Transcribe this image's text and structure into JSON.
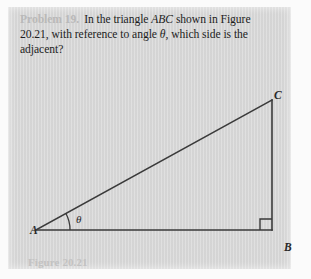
{
  "page": {
    "background_color": "#ffffff",
    "panel_color": "#d7d7d7"
  },
  "problem": {
    "label": "Problem 19.",
    "label_color": "#b9b9b9",
    "line1_a": "In the triangle ",
    "line1_italic": "ABC",
    "line1_b": " shown in",
    "line2_a": "Figure 20.21, with reference to angle ",
    "line2_italic": "θ",
    "line2_b": ", which side",
    "line3": "is the adjacent?"
  },
  "figure": {
    "caption": "Figure 20.21",
    "caption_color": "#c2c2c2",
    "stroke_color": "#3a3a3a",
    "vertices": {
      "A": {
        "label": "A",
        "x": 28,
        "y": 223
      },
      "B": {
        "label": "B",
        "x": 264,
        "y": 223
      },
      "C": {
        "label": "C",
        "x": 264,
        "y": 93
      }
    },
    "angle": {
      "label": "θ",
      "at_vertex": "A",
      "arc_radius": 34
    },
    "right_angle": {
      "at_vertex": "B",
      "marker": "square",
      "size": 11
    },
    "sides": [
      {
        "name": "hypotenuse",
        "from": "A",
        "to": "C"
      },
      {
        "name": "adjacent",
        "from": "A",
        "to": "B"
      },
      {
        "name": "opposite",
        "from": "B",
        "to": "C"
      }
    ]
  }
}
